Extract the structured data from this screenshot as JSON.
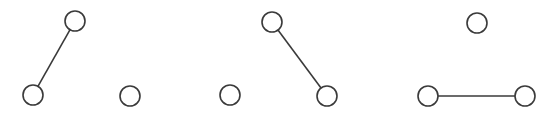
{
  "diagram": {
    "stroke_color": "#3a3a3a",
    "fill_color": "#ffffff",
    "node_radius": 10,
    "graphs": [
      {
        "nodes": [
          {
            "id": "top",
            "x": 75,
            "y": 21
          },
          {
            "id": "bottom-left",
            "x": 33,
            "y": 95
          },
          {
            "id": "bottom-right",
            "x": 130,
            "y": 96
          }
        ],
        "edges": [
          [
            "top",
            "bottom-left"
          ]
        ]
      },
      {
        "nodes": [
          {
            "id": "top",
            "x": 272,
            "y": 22
          },
          {
            "id": "bottom-left",
            "x": 230,
            "y": 95
          },
          {
            "id": "bottom-right",
            "x": 327,
            "y": 96
          }
        ],
        "edges": [
          [
            "top",
            "bottom-right"
          ]
        ]
      },
      {
        "nodes": [
          {
            "id": "top",
            "x": 477,
            "y": 23
          },
          {
            "id": "bottom-left",
            "x": 428,
            "y": 96
          },
          {
            "id": "bottom-right",
            "x": 525,
            "y": 96
          }
        ],
        "edges": [
          [
            "bottom-left",
            "bottom-right"
          ]
        ]
      }
    ]
  }
}
